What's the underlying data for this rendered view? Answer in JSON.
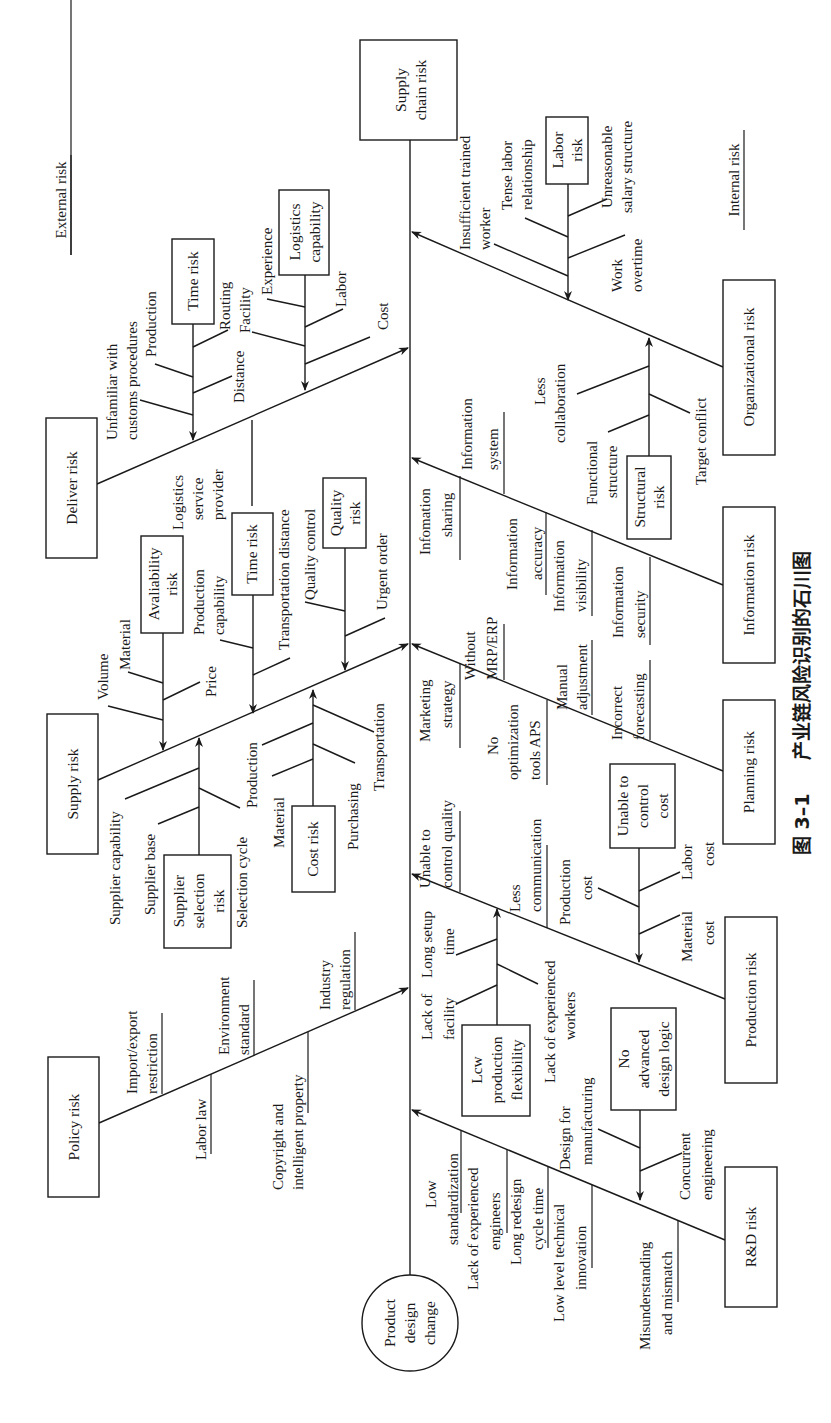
{
  "caption": {
    "figure_no": "图 3–1",
    "title": "产业链风险识别的石川图"
  },
  "head": {
    "line1": "Supply",
    "line2": "chain risk"
  },
  "tail": {
    "line1": "Product",
    "line2": "design",
    "line3": "change"
  },
  "sides": {
    "external": "External risk",
    "internal": "Internal risk"
  },
  "external": {
    "deliver": {
      "label": "Deliver risk",
      "time_risk": {
        "label": "Time risk",
        "causes": [
          "Unfamiliar with",
          "customs procedures",
          "Production",
          "Routing",
          "Distance"
        ]
      },
      "logistics": {
        "label1": "Logistics",
        "label2": "capability",
        "causes": [
          "Experience",
          "Facility",
          "Labor",
          "Cost"
        ]
      },
      "lsp": [
        "Logistics",
        "service",
        "provider"
      ]
    },
    "supply": {
      "label": "Supply risk",
      "availability": {
        "label1": "Avaliability",
        "label2": "risk",
        "causes": [
          "Volume",
          "Material",
          "Price",
          "Production",
          "capability"
        ]
      },
      "time_risk": {
        "label": "Time risk",
        "causes": [
          "Transportation distance"
        ]
      },
      "quality": {
        "label1": "Quality",
        "label2": "risk",
        "causes": [
          "Quality control",
          "Urgent order"
        ]
      },
      "supplier_selection": {
        "label1": "Supplier",
        "label2": "selection",
        "label3": "risk",
        "causes": [
          "Supplier capability",
          "Supplier base",
          "Selection cycle"
        ]
      },
      "cost": {
        "label": "Cost risk",
        "causes": [
          "Production",
          "Material",
          "Purchasing",
          "Transportation"
        ]
      }
    },
    "policy": {
      "label": "Policy risk",
      "causes": [
        {
          "l1": "Import/export",
          "l2": "restriction"
        },
        {
          "l1": "Labor law",
          "l2": ""
        },
        {
          "l1": "Environment",
          "l2": "standard"
        },
        {
          "l1": "Copyright and",
          "l2": "intelligent property"
        },
        {
          "l1": "Industry",
          "l2": "regulation"
        }
      ]
    }
  },
  "internal": {
    "organizational": {
      "label": "Organizational risk",
      "labor": {
        "label1": "Labor",
        "label2": "risk",
        "causes": [
          "Insufficient trained",
          "worker",
          "Tense labor",
          "relationship",
          "Unreasonable",
          "salary structure",
          "Work",
          "overtime"
        ]
      },
      "structural": {
        "label1": "Structural",
        "label2": "risk",
        "causes": [
          "Less",
          "collaboration",
          "Functional",
          "structure",
          "Target conflict"
        ]
      }
    },
    "information": {
      "label": "Information risk",
      "causes": [
        {
          "l1": "Infomation",
          "l2": "sharing"
        },
        {
          "l1": "Information",
          "l2": "system"
        },
        {
          "l1": "Information",
          "l2": "accuracy"
        },
        {
          "l1": "Information",
          "l2": "visibility"
        },
        {
          "l1": "Information",
          "l2": "security"
        }
      ]
    },
    "planning": {
      "label": "Planning risk",
      "causes": [
        {
          "l1": "Marketing",
          "l2": "strategy"
        },
        {
          "l1": "Without",
          "l2": "MRP/ERP"
        },
        {
          "l1": "No",
          "l2": "optimization",
          "l3": "tools APS"
        },
        {
          "l1": "Manual",
          "l2": "adjustment"
        },
        {
          "l1": "Incorrect",
          "l2": "forecasting"
        }
      ]
    },
    "production": {
      "label": "Production risk",
      "causes": [
        {
          "l1": "Unable to",
          "l2": "control quality"
        },
        {
          "l1": "Less",
          "l2": "communication"
        }
      ],
      "flexibility": {
        "label1": "Lcw",
        "label2": "production",
        "label3": "flexibility",
        "causes": [
          "Lack of",
          "facility",
          "Long setup",
          "time",
          "Lack of experienced",
          "workers"
        ]
      },
      "cost_control": {
        "label1": "Unable to",
        "label2": "control",
        "label3": "cost",
        "causes": [
          "Production",
          "cost",
          "Labor",
          "cost",
          "Material",
          "cost"
        ]
      }
    },
    "rnd": {
      "label": "R&D risk",
      "causes": [
        {
          "l1": "Low",
          "l2": "standardization"
        },
        {
          "l1": "Lack of experienced",
          "l2": "engineers"
        },
        {
          "l1": "Long redesign",
          "l2": "cycle time"
        },
        {
          "l1": "Low level technical",
          "l2": "innovation"
        },
        {
          "l1": "Misunderstanding",
          "l2": "and mismatch"
        }
      ],
      "design_logic": {
        "label1": "No",
        "label2": "advanced",
        "label3": "design logic",
        "causes": [
          "Design for",
          "manufacturing",
          "Concurrent",
          "engineering"
        ]
      }
    }
  }
}
